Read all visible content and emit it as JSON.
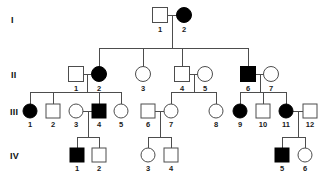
{
  "figure": {
    "kind": "pedigree-chart",
    "width": 328,
    "height": 188,
    "background_color": "#ffffff",
    "line_color": "#4d4d4d",
    "affected_fill_color": "#000000",
    "unaffected_fill_color": "#ffffff",
    "symbol_stroke_color": "#4d4d4d",
    "label_color": "#1a1a1a"
  },
  "legend_semantics": {
    "square": "male",
    "circle": "female",
    "filled": "affected",
    "open": "unaffected"
  },
  "generations": [
    {
      "id": "I",
      "label": "I",
      "label_x": 11,
      "label_y": 16,
      "row_y": 15
    },
    {
      "id": "II",
      "label": "II",
      "label_x": 11,
      "label_y": 71,
      "row_y": 74
    },
    {
      "id": "III",
      "label": "III",
      "label_x": 10,
      "label_y": 108,
      "row_y": 111
    },
    {
      "id": "IV",
      "label": "IV",
      "label_x": 10,
      "label_y": 152,
      "row_y": 155
    }
  ],
  "individuals": [
    {
      "key": "I-1",
      "generation": "I",
      "number": "1",
      "sex": "male",
      "shape": "square",
      "affected": false,
      "cx": 160,
      "cy": 15,
      "size": 15
    },
    {
      "key": "I-2",
      "generation": "I",
      "number": "2",
      "sex": "female",
      "shape": "circle",
      "affected": true,
      "cx": 184,
      "cy": 15,
      "size": 15
    },
    {
      "key": "II-1",
      "generation": "II",
      "number": "1",
      "sex": "male",
      "shape": "square",
      "affected": false,
      "cx": 76,
      "cy": 74,
      "size": 15
    },
    {
      "key": "II-2",
      "generation": "II",
      "number": "2",
      "sex": "female",
      "shape": "circle",
      "affected": true,
      "cx": 99,
      "cy": 74,
      "size": 15
    },
    {
      "key": "II-3",
      "generation": "II",
      "number": "3",
      "sex": "female",
      "shape": "circle",
      "affected": false,
      "cx": 143,
      "cy": 74,
      "size": 15
    },
    {
      "key": "II-4",
      "generation": "II",
      "number": "4",
      "sex": "male",
      "shape": "square",
      "affected": false,
      "cx": 182,
      "cy": 74,
      "size": 15
    },
    {
      "key": "II-5",
      "generation": "II",
      "number": "5",
      "sex": "female",
      "shape": "circle",
      "affected": false,
      "cx": 205,
      "cy": 74,
      "size": 15
    },
    {
      "key": "II-6",
      "generation": "II",
      "number": "6",
      "sex": "male",
      "shape": "square",
      "affected": true,
      "cx": 248,
      "cy": 74,
      "size": 15
    },
    {
      "key": "II-7",
      "generation": "II",
      "number": "7",
      "sex": "female",
      "shape": "circle",
      "affected": false,
      "cx": 271,
      "cy": 74,
      "size": 15
    },
    {
      "key": "III-1",
      "generation": "III",
      "number": "1",
      "sex": "female",
      "shape": "circle",
      "affected": true,
      "cx": 30,
      "cy": 111,
      "size": 14
    },
    {
      "key": "III-2",
      "generation": "III",
      "number": "2",
      "sex": "male",
      "shape": "square",
      "affected": false,
      "cx": 53,
      "cy": 111,
      "size": 14
    },
    {
      "key": "III-3",
      "generation": "III",
      "number": "3",
      "sex": "female",
      "shape": "circle",
      "affected": false,
      "cx": 76,
      "cy": 111,
      "size": 14
    },
    {
      "key": "III-4",
      "generation": "III",
      "number": "4",
      "sex": "male",
      "shape": "square",
      "affected": true,
      "cx": 99,
      "cy": 111,
      "size": 14
    },
    {
      "key": "III-5",
      "generation": "III",
      "number": "5",
      "sex": "female",
      "shape": "circle",
      "affected": false,
      "cx": 121,
      "cy": 111,
      "size": 14
    },
    {
      "key": "III-6",
      "generation": "III",
      "number": "6",
      "sex": "male",
      "shape": "square",
      "affected": false,
      "cx": 148,
      "cy": 111,
      "size": 14
    },
    {
      "key": "III-7",
      "generation": "III",
      "number": "7",
      "sex": "female",
      "shape": "circle",
      "affected": false,
      "cx": 171,
      "cy": 111,
      "size": 14
    },
    {
      "key": "III-8",
      "generation": "III",
      "number": "8",
      "sex": "female",
      "shape": "circle",
      "affected": false,
      "cx": 216,
      "cy": 111,
      "size": 14
    },
    {
      "key": "III-9",
      "generation": "III",
      "number": "9",
      "sex": "female",
      "shape": "circle",
      "affected": true,
      "cx": 240,
      "cy": 111,
      "size": 14
    },
    {
      "key": "III-10",
      "generation": "III",
      "number": "10",
      "sex": "male",
      "shape": "square",
      "affected": false,
      "cx": 263,
      "cy": 111,
      "size": 14
    },
    {
      "key": "III-11",
      "generation": "III",
      "number": "11",
      "sex": "female",
      "shape": "circle",
      "affected": true,
      "cx": 286,
      "cy": 111,
      "size": 14
    },
    {
      "key": "III-12",
      "generation": "III",
      "number": "12",
      "sex": "male",
      "shape": "square",
      "affected": false,
      "cx": 310,
      "cy": 111,
      "size": 14
    },
    {
      "key": "IV-1",
      "generation": "IV",
      "number": "1",
      "sex": "male",
      "shape": "square",
      "affected": true,
      "cx": 77,
      "cy": 155,
      "size": 14
    },
    {
      "key": "IV-2",
      "generation": "IV",
      "number": "2",
      "sex": "male",
      "shape": "square",
      "affected": false,
      "cx": 99,
      "cy": 155,
      "size": 14
    },
    {
      "key": "IV-3",
      "generation": "IV",
      "number": "3",
      "sex": "female",
      "shape": "circle",
      "affected": false,
      "cx": 148,
      "cy": 155,
      "size": 14
    },
    {
      "key": "IV-4",
      "generation": "IV",
      "number": "4",
      "sex": "male",
      "shape": "square",
      "affected": false,
      "cx": 171,
      "cy": 155,
      "size": 14
    },
    {
      "key": "IV-5",
      "generation": "IV",
      "number": "5",
      "sex": "male",
      "shape": "square",
      "affected": true,
      "cx": 282,
      "cy": 155,
      "size": 14
    },
    {
      "key": "IV-6",
      "generation": "IV",
      "number": "6",
      "sex": "female",
      "shape": "circle",
      "affected": false,
      "cx": 305,
      "cy": 155,
      "size": 14
    }
  ],
  "matings": [
    {
      "key": "I-1xI-2",
      "partners": [
        "I-1",
        "I-2"
      ],
      "x1": 168,
      "x2": 177,
      "y": 15
    },
    {
      "key": "II-1xII-2",
      "partners": [
        "II-1",
        "II-2"
      ],
      "x1": 84,
      "x2": 91,
      "y": 74
    },
    {
      "key": "II-4xII-5",
      "partners": [
        "II-4",
        "II-5"
      ],
      "x1": 190,
      "x2": 198,
      "y": 74
    },
    {
      "key": "II-6xII-7",
      "partners": [
        "II-6",
        "II-7"
      ],
      "x1": 256,
      "x2": 264,
      "y": 74
    },
    {
      "key": "III-3xIII-4",
      "partners": [
        "III-3",
        "III-4"
      ],
      "x1": 83,
      "x2": 92,
      "y": 111
    },
    {
      "key": "III-6xIII-7",
      "partners": [
        "III-6",
        "III-7"
      ],
      "x1": 155,
      "x2": 164,
      "y": 111
    },
    {
      "key": "III-11xIII-12",
      "partners": [
        "III-11",
        "III-12"
      ],
      "x1": 293,
      "x2": 303,
      "y": 111
    }
  ],
  "sibships": [
    {
      "key": "sibship-gen2",
      "parents": "I-1xI-2",
      "drop_x": 172,
      "drop_from_y": 15,
      "bar_y": 48,
      "bar_x1": 99,
      "bar_x2": 248,
      "children": [
        "II-2",
        "II-3",
        "II-4",
        "II-6"
      ],
      "child_drops": [
        {
          "child": "II-2",
          "x": 99,
          "to_y": 67
        },
        {
          "child": "II-3",
          "x": 143,
          "to_y": 67
        },
        {
          "child": "II-4",
          "x": 182,
          "to_y": 67
        },
        {
          "child": "II-6",
          "x": 248,
          "to_y": 67
        }
      ]
    },
    {
      "key": "sibship-gen3-a",
      "parents": "II-1xII-2",
      "drop_x": 87,
      "drop_from_y": 74,
      "bar_y": 92,
      "bar_x1": 30,
      "bar_x2": 121,
      "children": [
        "III-1",
        "III-2",
        "III-4",
        "III-5"
      ],
      "child_drops": [
        {
          "child": "III-1",
          "x": 30,
          "to_y": 104
        },
        {
          "child": "III-2",
          "x": 53,
          "to_y": 104
        },
        {
          "child": "III-4",
          "x": 99,
          "to_y": 104
        },
        {
          "child": "III-5",
          "x": 121,
          "to_y": 104
        }
      ]
    },
    {
      "key": "sibship-gen3-b",
      "parents": "II-4xII-5",
      "drop_x": 194,
      "drop_from_y": 74,
      "bar_y": 92,
      "bar_x1": 171,
      "bar_x2": 216,
      "children": [
        "III-7",
        "III-8"
      ],
      "child_drops": [
        {
          "child": "III-7",
          "x": 171,
          "to_y": 104
        },
        {
          "child": "III-8",
          "x": 216,
          "to_y": 104
        }
      ]
    },
    {
      "key": "sibship-gen3-c",
      "parents": "II-6xII-7",
      "drop_x": 260,
      "drop_from_y": 74,
      "bar_y": 92,
      "bar_x1": 240,
      "bar_x2": 286,
      "children": [
        "III-9",
        "III-10",
        "III-11"
      ],
      "child_drops": [
        {
          "child": "III-9",
          "x": 240,
          "to_y": 104
        },
        {
          "child": "III-10",
          "x": 263,
          "to_y": 104
        },
        {
          "child": "III-11",
          "x": 286,
          "to_y": 104
        }
      ]
    },
    {
      "key": "sibship-gen4-a",
      "parents": "III-3xIII-4",
      "drop_x": 88,
      "drop_from_y": 111,
      "bar_y": 137,
      "bar_x1": 77,
      "bar_x2": 99,
      "children": [
        "IV-1",
        "IV-2"
      ],
      "child_drops": [
        {
          "child": "IV-1",
          "x": 77,
          "to_y": 148
        },
        {
          "child": "IV-2",
          "x": 99,
          "to_y": 148
        }
      ]
    },
    {
      "key": "sibship-gen4-b",
      "parents": "III-6xIII-7",
      "drop_x": 160,
      "drop_from_y": 111,
      "bar_y": 137,
      "bar_x1": 148,
      "bar_x2": 171,
      "children": [
        "IV-3",
        "IV-4"
      ],
      "child_drops": [
        {
          "child": "IV-3",
          "x": 148,
          "to_y": 148
        },
        {
          "child": "IV-4",
          "x": 171,
          "to_y": 148
        }
      ]
    },
    {
      "key": "sibship-gen4-c",
      "parents": "III-11xIII-12",
      "drop_x": 298,
      "drop_from_y": 111,
      "bar_y": 137,
      "bar_x1": 282,
      "bar_x2": 305,
      "children": [
        "IV-5",
        "IV-6"
      ],
      "child_drops": [
        {
          "child": "IV-5",
          "x": 282,
          "to_y": 148
        },
        {
          "child": "IV-6",
          "x": 305,
          "to_y": 148
        }
      ]
    }
  ]
}
